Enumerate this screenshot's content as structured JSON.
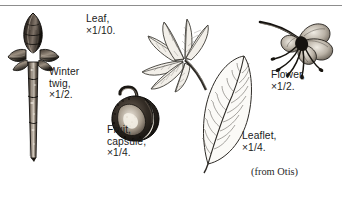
{
  "plate": {
    "name": "botanical-plate-horse-chestnut",
    "background_color": "#ffffff",
    "ink_color": "#1a1a1a",
    "rule_color": "#8d8d8d"
  },
  "labels": {
    "winter_twig": "Winter\ntwig,\n×1/2.",
    "leaf": "Leaf,\n×1/10.",
    "fruit": "Fruit,\ncapsule,\n×1/4.",
    "leaflet": "Leaflet,\n×1/4.",
    "flower": "Flower,\n×1/2."
  },
  "credit": {
    "text": "(from Otis)"
  },
  "figures": [
    {
      "name": "winter-twig",
      "caption": "Winter twig, ×1/2.",
      "magnification": "×1/2"
    },
    {
      "name": "leaf",
      "caption": "Leaf, ×1/10.",
      "magnification": "×1/10"
    },
    {
      "name": "fruit-capsule",
      "caption": "Fruit, capsule, ×1/4.",
      "magnification": "×1/4"
    },
    {
      "name": "leaflet",
      "caption": "Leaflet, ×1/4.",
      "magnification": "×1/4"
    },
    {
      "name": "flower",
      "caption": "Flower, ×1/2.",
      "magnification": "×1/2"
    }
  ]
}
